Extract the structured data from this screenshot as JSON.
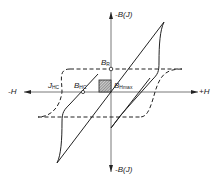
{
  "diagram": {
    "type": "hysteresis-loop",
    "axes": {
      "x_positive": "+H",
      "x_negative": "-H",
      "y_positive": "-B(J)",
      "y_negative": "-B(J)"
    },
    "labels": {
      "br_main": "B",
      "br_sub": "R",
      "bhmax_main": "B",
      "bhmax_sub": "Hmax",
      "jhc_main": "J",
      "jhc_sub": "HC",
      "bhc_main": "B",
      "bhc_sub": "HC"
    },
    "curves": [
      {
        "name": "B-H loop",
        "style": "solid"
      },
      {
        "name": "J-H loop",
        "style": "dashed"
      }
    ],
    "colors": {
      "line": "#222222",
      "hatch": "#888888",
      "axis": "#333333"
    }
  }
}
